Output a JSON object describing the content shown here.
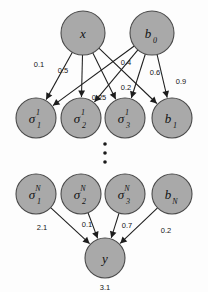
{
  "diagram": {
    "background_color": "#fdfdfd",
    "node_fill_color": "#a9a9a9",
    "node_stroke_color": "#4a4a4a",
    "edge_color": "#1d1d1d",
    "text_color": "#121212"
  },
  "nodes": {
    "input_layer": [
      {
        "id": "x",
        "base": "x",
        "sup": "",
        "sub": "",
        "cx": 83,
        "cy": 33,
        "r": 22
      },
      {
        "id": "b0",
        "base": "b",
        "sup": "",
        "sub": "0",
        "cx": 152,
        "cy": 33,
        "r": 22
      }
    ],
    "hidden_layer_1": [
      {
        "id": "sigma_1_1",
        "base": "σ",
        "sup": "1",
        "sub": "1",
        "cx": 36,
        "cy": 118,
        "r": 20
      },
      {
        "id": "sigma_1_2",
        "base": "σ",
        "sup": "1",
        "sub": "2",
        "cx": 81,
        "cy": 118,
        "r": 20
      },
      {
        "id": "sigma_1_3",
        "base": "σ",
        "sup": "1",
        "sub": "3",
        "cx": 125,
        "cy": 118,
        "r": 20
      },
      {
        "id": "b_1",
        "base": "b",
        "sup": "",
        "sub": "1",
        "cx": 172,
        "cy": 118,
        "r": 20
      }
    ],
    "hidden_layer_n": [
      {
        "id": "sigma_N_1",
        "base": "σ",
        "sup": "N",
        "sub": "1",
        "cx": 36,
        "cy": 194,
        "r": 20
      },
      {
        "id": "sigma_N_2",
        "base": "σ",
        "sup": "N",
        "sub": "2",
        "cx": 81,
        "cy": 194,
        "r": 20
      },
      {
        "id": "sigma_N_3",
        "base": "σ",
        "sup": "N",
        "sub": "3",
        "cx": 125,
        "cy": 194,
        "r": 20
      },
      {
        "id": "b_N",
        "base": "b",
        "sup": "",
        "sub": "N",
        "cx": 172,
        "cy": 194,
        "r": 20
      }
    ],
    "output_layer": [
      {
        "id": "y",
        "base": "y",
        "sup": "",
        "sub": "",
        "cx": 105,
        "cy": 258,
        "r": 20
      }
    ]
  },
  "edges_top": [
    {
      "from": "x",
      "to": "sigma_1_1",
      "weight": "0.1",
      "lx": 39,
      "ly": 64
    },
    {
      "from": "x",
      "to": "sigma_1_2",
      "weight": "0.5",
      "lx": 63,
      "ly": 70
    },
    {
      "from": "x",
      "to": "sigma_1_3",
      "weight": "0.25",
      "lx": 99,
      "ly": 97
    },
    {
      "from": "x",
      "to": "b_1",
      "weight": "",
      "lx": 0,
      "ly": 0
    },
    {
      "from": "b0",
      "to": "sigma_1_1",
      "weight": "0.4",
      "lx": 126,
      "ly": 62
    },
    {
      "from": "b0",
      "to": "sigma_1_2",
      "weight": "0.6",
      "lx": 155,
      "ly": 72
    },
    {
      "from": "b0",
      "to": "sigma_1_3",
      "weight": "0.2",
      "lx": 126,
      "ly": 87
    },
    {
      "from": "b0",
      "to": "b_1",
      "weight": "0.9",
      "lx": 181,
      "ly": 81
    }
  ],
  "edges_bottom": [
    {
      "from": "sigma_N_1",
      "to": "y",
      "weight": "2.1",
      "lx": 42,
      "ly": 227
    },
    {
      "from": "sigma_N_2",
      "to": "y",
      "weight": "0.1",
      "lx": 87,
      "ly": 224
    },
    {
      "from": "sigma_N_3",
      "to": "y",
      "weight": "0.7",
      "lx": 127,
      "ly": 225
    },
    {
      "from": "b_N",
      "to": "y",
      "weight": "0.2",
      "lx": 166,
      "ly": 230
    }
  ],
  "output_value": "3.1",
  "ellipsis": {
    "count": 3,
    "cx": 105,
    "ys": [
      144,
      153,
      162
    ],
    "r": 1.8
  }
}
